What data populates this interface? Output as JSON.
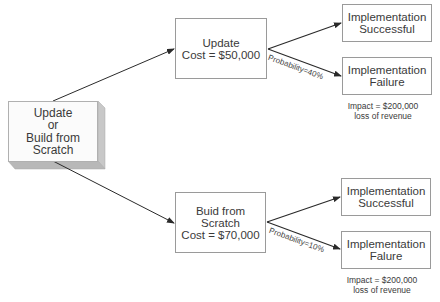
{
  "diagram": {
    "type": "decision-tree",
    "root": {
      "lines": [
        "Update",
        "or",
        "Build from Scratch"
      ]
    },
    "branches": [
      {
        "option": {
          "lines": [
            "Update",
            "Cost = $50,000"
          ]
        },
        "probability_label": "Probability=40%",
        "outcomes": [
          {
            "lines": [
              "Implementation",
              "Successful"
            ]
          },
          {
            "lines": [
              "Implementation",
              "Failure"
            ],
            "impact": [
              "Impact = $200,000",
              "loss of revenue"
            ]
          }
        ]
      },
      {
        "option": {
          "lines": [
            "Buid from Scratch",
            "Cost = $70,000"
          ]
        },
        "probability_label": "Probability=10%",
        "outcomes": [
          {
            "lines": [
              "Implementation",
              "Successful"
            ]
          },
          {
            "lines": [
              "Implementation",
              "Falure"
            ],
            "impact": [
              "Impact = $200,000",
              "loss of revenue"
            ]
          }
        ]
      }
    ]
  },
  "colors": {
    "line": "#2a2a2a",
    "box_border": "#9a9a9a",
    "shadow": "#bdbdbd"
  }
}
